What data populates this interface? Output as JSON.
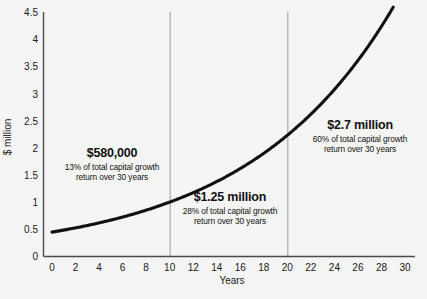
{
  "chart_data": {
    "type": "line",
    "title": "",
    "xlabel": "Years",
    "ylabel": "$ million",
    "xlim": [
      0,
      30
    ],
    "ylim": [
      0,
      4.75
    ],
    "grid": false,
    "legend": null,
    "x_ticks": [
      "0",
      "2",
      "4",
      "6",
      "8",
      "10",
      "12",
      "14",
      "16",
      "18",
      "20",
      "22",
      "24",
      "26",
      "28",
      "30"
    ],
    "y_ticks": [
      "0",
      "0.5",
      "1",
      "1.5",
      "2",
      "2.5",
      "3",
      "3.5",
      "4",
      "4.5"
    ],
    "series": [
      {
        "name": "capital growth",
        "x": [
          0,
          1,
          2,
          3,
          4,
          5,
          6,
          7,
          8,
          9,
          10,
          11,
          12,
          13,
          14,
          15,
          16,
          17,
          18,
          19,
          20,
          21,
          22,
          23,
          24,
          25,
          26,
          27,
          28,
          29
        ],
        "values": [
          0.45,
          0.48,
          0.51,
          0.55,
          0.59,
          0.63,
          0.67,
          0.72,
          0.77,
          0.82,
          1.18,
          1.26,
          1.35,
          1.44,
          1.54,
          1.65,
          1.76,
          1.88,
          2.01,
          2.15,
          2.35,
          2.51,
          2.68,
          2.87,
          3.06,
          3.27,
          3.5,
          3.74,
          4.0,
          4.6
        ]
      }
    ],
    "vertical_dividers": [
      10,
      20
    ],
    "annotations": [
      {
        "amount": "$580,000",
        "line1": "13% of total capital growth",
        "line2": "return over 30 years",
        "percent": 13,
        "period": "years 0-10"
      },
      {
        "amount": "$1.25 million",
        "line1": "28% of total capital growth",
        "line2": "return over 30 years",
        "percent": 28,
        "period": "years 10-20"
      },
      {
        "amount": "$2.7 million",
        "line1": "60% of total capital growth",
        "line2": "return over 30 years",
        "percent": 60,
        "period": "years 20-30"
      }
    ],
    "colors": {
      "background": "#f5f5f5",
      "curve": "#111111",
      "axis": "#4a4a4a",
      "divider": "#9a9a9a",
      "text": "#111111"
    }
  }
}
